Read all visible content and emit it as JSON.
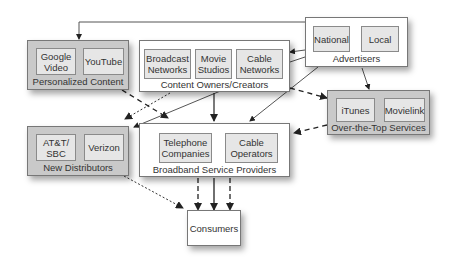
{
  "diagram": {
    "groups": {
      "personalized_content": {
        "label": "Personalized Content",
        "items": [
          "Google\nVideo",
          "YouTube"
        ]
      },
      "content_owners": {
        "label": "Content Owners/Creators",
        "items": [
          "Broadcast\nNetworks",
          "Movie\nStudios",
          "Cable\nNetworks"
        ]
      },
      "advertisers": {
        "label": "Advertisers",
        "items": [
          "National",
          "Local"
        ]
      },
      "new_distributors": {
        "label": "New Distributors",
        "items": [
          "AT&T/\nSBC",
          "Verizon"
        ]
      },
      "broadband": {
        "label": "Broadband Service Providers",
        "items": [
          "Telephone\nCompanies",
          "Cable\nOperators"
        ]
      },
      "ott": {
        "label": "Over-the-Top Services",
        "items": [
          "iTunes",
          "Movielink"
        ]
      }
    },
    "consumers": {
      "label": "Consumers"
    },
    "edges": [
      {
        "from": "Advertisers",
        "to": "Personalized Content",
        "style": "solid"
      },
      {
        "from": "Advertisers",
        "to": "Content Owners/Creators",
        "style": "solid"
      },
      {
        "from": "Advertisers",
        "to": "Broadband Service Providers",
        "style": "solid"
      },
      {
        "from": "Advertisers",
        "to": "Over-the-Top Services",
        "style": "solid"
      },
      {
        "from": "Content Owners/Creators",
        "to": "Broadband Service Providers",
        "style": "solid"
      },
      {
        "from": "Content Owners/Creators",
        "to": "New Distributors",
        "style": "dotted"
      },
      {
        "from": "Content Owners/Creators",
        "to": "Over-the-Top Services",
        "style": "dashed"
      },
      {
        "from": "Personalized Content",
        "to": "Broadband Service Providers",
        "style": "dashed"
      },
      {
        "from": "Over-the-Top Services",
        "to": "Broadband Service Providers",
        "style": "dashed"
      },
      {
        "from": "New Distributors",
        "to": "Consumers",
        "style": "dotted"
      },
      {
        "from": "Broadband Service Providers",
        "to": "Consumers",
        "style": "dashed"
      },
      {
        "from": "Broadband Service Providers",
        "to": "Consumers",
        "style": "solid"
      },
      {
        "from": "Broadband Service Providers",
        "to": "Consumers",
        "style": "dashed"
      }
    ]
  }
}
